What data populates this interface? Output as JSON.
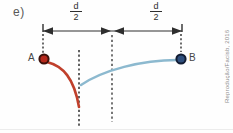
{
  "figure": {
    "item_label": "e)",
    "credit": "Reprodução/Facisb, 2016",
    "dimension": {
      "segments": [
        {
          "numerator": "d",
          "denominator": "2"
        },
        {
          "numerator": "d",
          "denominator": "2"
        }
      ]
    },
    "points": [
      {
        "label": "A"
      },
      {
        "label": "B"
      }
    ],
    "colors": {
      "line": "#2e2e2e",
      "text": "#474747",
      "credit_text": "#8d8d8d",
      "trajectory_a": "#c0402c",
      "trajectory_b": "#8cb9cf",
      "point_a_fill": "#b5281c",
      "point_a_stroke": "#3c100a",
      "point_b_fill": "#2f4f7d",
      "point_b_stroke": "#111c33"
    }
  }
}
